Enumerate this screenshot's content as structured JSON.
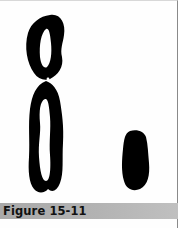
{
  "figure": {
    "caption": "Figure 15-11",
    "subjects": [
      {
        "name": "large-chromosome",
        "description": "X-shaped chromosome with two loops"
      },
      {
        "name": "small-chromosome",
        "description": "small oval chromosome"
      }
    ],
    "colors": {
      "ink": "#000000",
      "paper": "#ffffff",
      "caption_bar": "#b0b0b0",
      "border": "#8a8a8a"
    }
  }
}
